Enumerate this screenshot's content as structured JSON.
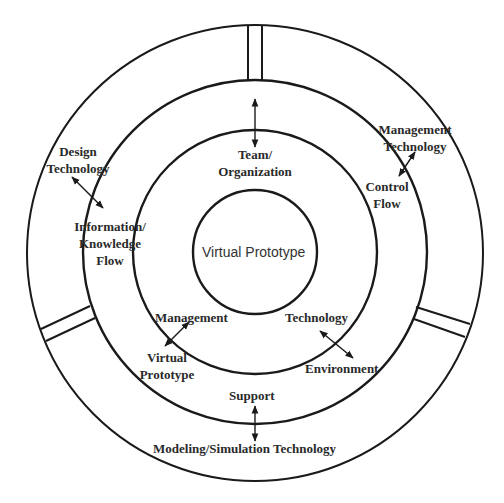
{
  "diagram": {
    "type": "concentric-circles",
    "center": {
      "label": "Virtual Prototype"
    },
    "rings": [
      {
        "name": "inner-ring",
        "labels": {
          "team": [
            "Team/",
            "Organization"
          ],
          "management": "Management",
          "technology": "Technology"
        }
      },
      {
        "name": "middle-ring",
        "labels": {
          "information": [
            "Information/",
            "Knowledge",
            "Flow"
          ],
          "control": [
            "Control",
            "Flow"
          ],
          "virtual_prototype": [
            "Virtual",
            "Prototype"
          ],
          "environment": "Environment",
          "support": "Support"
        }
      },
      {
        "name": "outer-ring",
        "labels": {
          "design_technology": [
            "Design",
            "Technology"
          ],
          "management_technology": [
            "Management",
            "Technology"
          ],
          "modeling_simulation": "Modeling/Simulation Technology"
        }
      }
    ],
    "connections": [
      {
        "from": "Design Technology",
        "to": "Information/Knowledge Flow"
      },
      {
        "from": "Management Technology",
        "to": "Control Flow"
      },
      {
        "from": "Team/Organization",
        "to": "outer divider (top)"
      },
      {
        "from": "Management",
        "to": "Virtual Prototype"
      },
      {
        "from": "Technology",
        "to": "Environment"
      },
      {
        "from": "Support",
        "to": "Modeling/Simulation Technology"
      }
    ],
    "colors": {
      "stroke": "#1a1a1a",
      "text": "#2a2a2a",
      "background": "#ffffff"
    }
  }
}
